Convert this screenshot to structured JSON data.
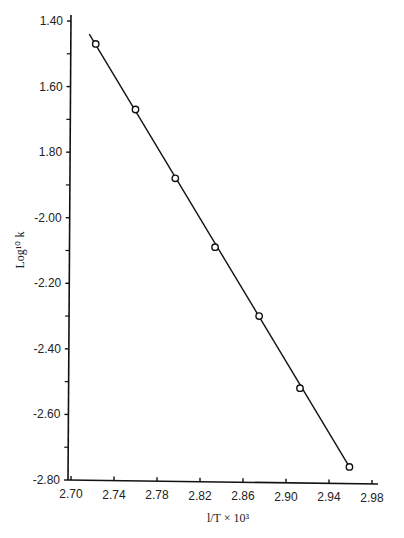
{
  "chart_data": {
    "type": "line",
    "title": "",
    "xlabel": "l/T × 10³",
    "ylabel": "Log¹⁰ k",
    "xlim": [
      2.7,
      2.98
    ],
    "ylim": [
      -2.8,
      -1.4
    ],
    "grid": false,
    "xticks": [
      2.7,
      2.74,
      2.78,
      2.82,
      2.86,
      2.9,
      2.94,
      2.98
    ],
    "xtick_labels": [
      "2.70",
      "2.74",
      "2.78",
      "2.82",
      "2.86",
      "2.90",
      "2.94",
      "2.98"
    ],
    "yticks": [
      -1.4,
      -1.6,
      -1.8,
      -2.0,
      -2.2,
      -2.4,
      -2.6,
      -2.8
    ],
    "ytick_labels": [
      "1.40",
      "1.60",
      "1.80",
      "-2.00",
      "-2.20",
      "-2.40",
      "-2.60",
      "-2.80"
    ],
    "y_minor_ticks": [
      -1.5,
      -1.7,
      -1.9,
      -2.1,
      -2.3,
      -2.5,
      -2.7
    ],
    "series": [
      {
        "name": "data",
        "marker": "open-circle",
        "x": [
          2.723,
          2.76,
          2.797,
          2.834,
          2.875,
          2.913,
          2.959
        ],
        "y": [
          -1.47,
          -1.67,
          -1.88,
          -2.09,
          -2.3,
          -2.52,
          -2.76
        ]
      }
    ],
    "fit_line": {
      "x": [
        2.717,
        2.959
      ],
      "y": [
        -1.44,
        -2.76
      ]
    }
  }
}
